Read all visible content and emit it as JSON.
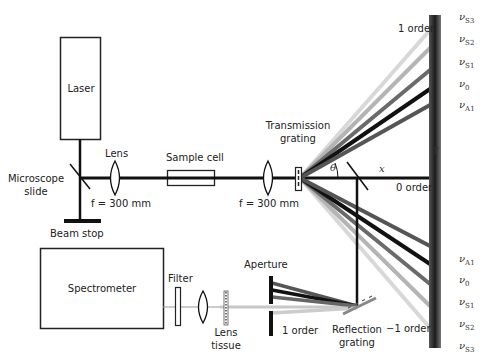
{
  "diagram": {
    "components": {
      "laser": "Laser",
      "lens1": "Lens",
      "sample_cell": "Sample cell",
      "microscope_slide": "Microscope\nslide",
      "microscope_slide_line1": "Microscope",
      "microscope_slide_line2": "slide",
      "focal_length_1": "f = 300 mm",
      "focal_length_2": "f = 300 mm",
      "beam_stop": "Beam stop",
      "transmission_grating_line1": "Transmission",
      "transmission_grating_line2": "grating",
      "spectrometer": "Spectrometer",
      "filter": "Filter",
      "lens_tissue_line1": "Lens",
      "lens_tissue_line2": "tissue",
      "aperture": "Aperture",
      "reflection_grating_line1": "Reflection",
      "reflection_grating_line2": "grating"
    },
    "orders": {
      "plus_one": "1 order",
      "zero": "0 order",
      "minus_one": "−1 order",
      "aperture_order": "1 order"
    },
    "geometry_labels": {
      "theta": "θ",
      "x": "x",
      "y": "y"
    },
    "upper_lines": [
      {
        "symbol": "ν",
        "sub": "S3",
        "color": "#d4d4d4"
      },
      {
        "symbol": "ν",
        "sub": "S2",
        "color": "#b0b0b0"
      },
      {
        "symbol": "ν",
        "sub": "S1",
        "color": "#666666"
      },
      {
        "symbol": "ν",
        "sub": "0",
        "color": "#111111"
      },
      {
        "symbol": "ν",
        "sub": "A1",
        "color": "#555555"
      }
    ],
    "lower_lines": [
      {
        "symbol": "ν",
        "sub": "A1",
        "color": "#555555"
      },
      {
        "symbol": "ν",
        "sub": "0",
        "color": "#111111"
      },
      {
        "symbol": "ν",
        "sub": "S1",
        "color": "#666666"
      },
      {
        "symbol": "ν",
        "sub": "S2",
        "color": "#b0b0b0"
      },
      {
        "symbol": "ν",
        "sub": "S3",
        "color": "#d4d4d4"
      }
    ]
  }
}
